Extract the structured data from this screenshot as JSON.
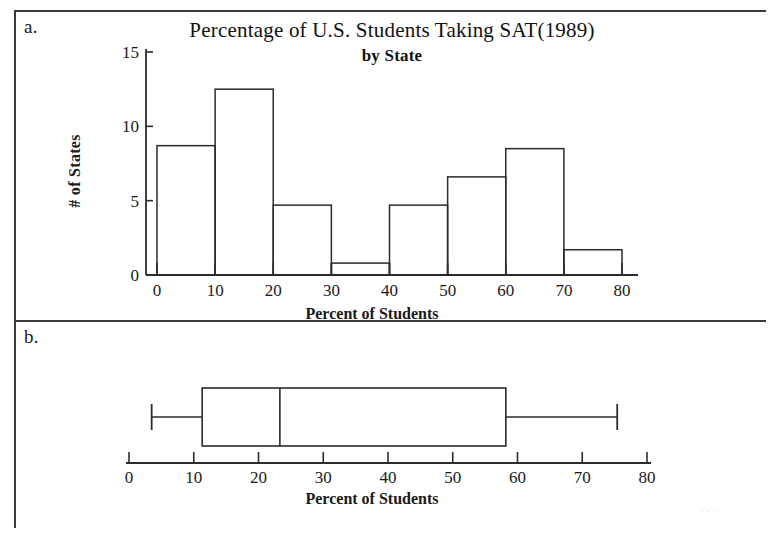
{
  "figure": {
    "panel_a_letter": "a.",
    "panel_b_letter": "b."
  },
  "chart_data": [
    {
      "type": "bar",
      "panel": "a",
      "title": "Percentage of  U.S. Students Taking SAT(1989)",
      "subtitle": "by State",
      "xlabel": "Percent of Students",
      "ylabel": "# of States",
      "xlim": [
        0,
        80
      ],
      "ylim": [
        0,
        15
      ],
      "xticks": [
        "0",
        "10",
        "20",
        "30",
        "40",
        "50",
        "60",
        "70",
        "80"
      ],
      "yticks": [
        "0",
        "5",
        "10",
        "15"
      ],
      "grid": false,
      "bin_width": 10,
      "bin_edges": [
        0,
        10,
        20,
        30,
        40,
        50,
        60,
        70,
        80
      ],
      "categories": [
        "0-10",
        "10-20",
        "20-30",
        "30-40",
        "40-50",
        "50-60",
        "60-70",
        "70-80"
      ],
      "values": [
        8.7,
        12.5,
        4.7,
        0.8,
        4.7,
        6.6,
        8.5,
        1.7
      ]
    },
    {
      "type": "boxplot",
      "panel": "b",
      "title": "",
      "xlabel": "Percent of Students",
      "xlim": [
        0,
        80
      ],
      "xticks": [
        "0",
        "10",
        "20",
        "30",
        "40",
        "50",
        "60",
        "70",
        "80"
      ],
      "grid": false,
      "orientation": "horizontal",
      "box": {
        "min_whisker": 3.5,
        "q1": 11.3,
        "median": 23.3,
        "q3": 58.2,
        "max_whisker": 75.4
      }
    }
  ]
}
